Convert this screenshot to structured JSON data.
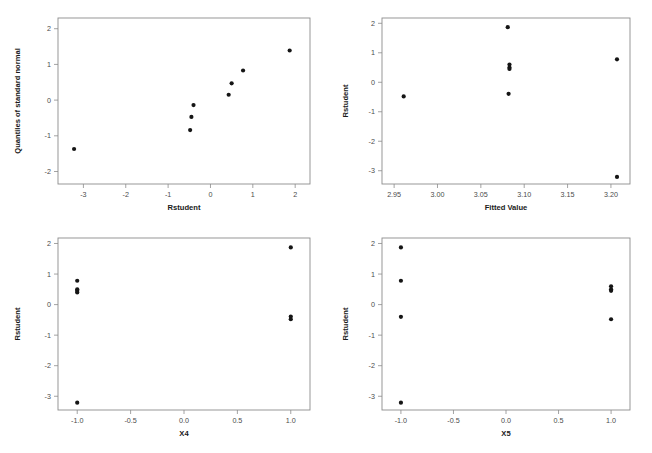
{
  "figure": {
    "background_color": "#ffffff",
    "point_color": "#151515",
    "axis_color": "#8c8c8c",
    "top_residual_text": ""
  },
  "chart_data": [
    {
      "id": "normal-probability-plot",
      "type": "scatter",
      "title": "",
      "xlabel": "Rstudent",
      "ylabel": "Quantiles of standard normal",
      "xlim": [
        -3.6,
        2.35
      ],
      "ylim": [
        -2.35,
        2.3
      ],
      "xticks": [
        "-3",
        "-2",
        "-1",
        "0",
        "1",
        "2"
      ],
      "xtickvalues": [
        -3,
        -2,
        -1,
        0,
        1,
        2
      ],
      "yticks": [
        "2",
        "1",
        "0",
        "-1",
        "-2"
      ],
      "ytickvalues": [
        2,
        1,
        0,
        -1,
        -2
      ],
      "grid": false,
      "legend": "none",
      "x": [
        -3.22,
        -0.48,
        -0.45,
        -0.4,
        0.43,
        0.5,
        0.77,
        1.87
      ],
      "y": [
        -1.37,
        -0.84,
        -0.47,
        -0.14,
        0.15,
        0.47,
        0.83,
        1.39
      ]
    },
    {
      "id": "residuals-vs-fitted",
      "type": "scatter",
      "title": "",
      "xlabel": "Fitted Value",
      "ylabel": "Rstudent",
      "xlim": [
        2.936,
        3.222
      ],
      "ylim": [
        -3.45,
        2.18
      ],
      "xticks": [
        "2.95",
        "3.00",
        "3.05",
        "3.10",
        "3.15",
        "3.20"
      ],
      "xtickvalues": [
        2.95,
        3.0,
        3.05,
        3.1,
        3.15,
        3.2
      ],
      "yticks": [
        "2",
        "1",
        "0",
        "-1",
        "-2",
        "-3"
      ],
      "ytickvalues": [
        2,
        1,
        0,
        -1,
        -2,
        -3
      ],
      "grid": false,
      "legend": "none",
      "x": [
        2.961,
        3.081,
        3.083,
        3.083,
        3.083,
        3.082,
        3.207,
        3.207
      ],
      "y": [
        -0.48,
        1.87,
        0.6,
        0.5,
        0.45,
        -0.39,
        0.78,
        -3.21
      ]
    },
    {
      "id": "residuals-vs-x4",
      "type": "scatter",
      "title": "",
      "xlabel": "X4",
      "ylabel": "Rstudent",
      "xlim": [
        -1.18,
        1.18
      ],
      "ylim": [
        -3.45,
        2.18
      ],
      "xticks": [
        "-1.0",
        "-0.5",
        "0.0",
        "0.5",
        "1.0"
      ],
      "xtickvalues": [
        -1.0,
        -0.5,
        0.0,
        0.5,
        1.0
      ],
      "yticks": [
        "2",
        "1",
        "0",
        "-1",
        "-2",
        "-3"
      ],
      "ytickvalues": [
        2,
        1,
        0,
        -1,
        -2,
        -3
      ],
      "grid": false,
      "legend": "none",
      "x": [
        -1.0,
        -1.0,
        -1.0,
        -1.0,
        -1.0,
        1.0,
        1.0,
        1.0
      ],
      "y": [
        0.78,
        0.5,
        0.45,
        0.4,
        -3.21,
        1.87,
        -0.39,
        -0.48
      ]
    },
    {
      "id": "residuals-vs-x5",
      "type": "scatter",
      "title": "",
      "xlabel": "X5",
      "ylabel": "Rstudent",
      "xlim": [
        -1.18,
        1.18
      ],
      "ylim": [
        -3.45,
        2.18
      ],
      "xticks": [
        "-1.0",
        "-0.5",
        "0.0",
        "0.5",
        "1.0"
      ],
      "xtickvalues": [
        -1.0,
        -0.5,
        0.0,
        0.5,
        1.0
      ],
      "yticks": [
        "2",
        "1",
        "0",
        "-1",
        "-2",
        "-3"
      ],
      "ytickvalues": [
        2,
        1,
        0,
        -1,
        -2,
        -3
      ],
      "grid": false,
      "legend": "none",
      "x": [
        -1.0,
        -1.0,
        -1.0,
        -1.0,
        1.0,
        1.0,
        1.0,
        1.0
      ],
      "y": [
        1.87,
        0.78,
        -0.4,
        -3.21,
        0.6,
        0.5,
        0.45,
        -0.48
      ]
    }
  ]
}
